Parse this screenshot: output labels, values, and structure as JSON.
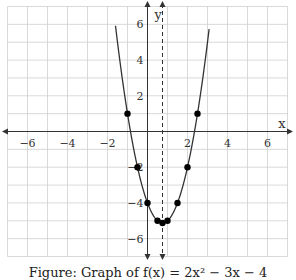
{
  "chart_data": {
    "type": "line",
    "title": "",
    "function": "f(x) = 2x^2 - 3x - 4",
    "xlabel": "x",
    "ylabel": "y",
    "xlim": [
      -7,
      7
    ],
    "ylim": [
      -7,
      7
    ],
    "grid": true,
    "x_tick_labels": [
      "-6",
      "-4",
      "-2",
      "2",
      "4",
      "6"
    ],
    "x_ticks": [
      -6,
      -4,
      -2,
      2,
      4,
      6
    ],
    "y_tick_labels": [
      "6",
      "4",
      "2",
      "-2",
      "-4",
      "-6"
    ],
    "y_ticks": [
      6,
      4,
      2,
      -2,
      -4,
      -6
    ],
    "axis_of_symmetry": {
      "x": 0.75,
      "style": "dashed"
    },
    "points": [
      {
        "x": -1,
        "y": 1
      },
      {
        "x": -0.5,
        "y": -2
      },
      {
        "x": 0,
        "y": -4
      },
      {
        "x": 0.5,
        "y": -5
      },
      {
        "x": 0.75,
        "y": -5.125
      },
      {
        "x": 1,
        "y": -5
      },
      {
        "x": 1.5,
        "y": -4
      },
      {
        "x": 2,
        "y": -2
      },
      {
        "x": 2.5,
        "y": 1
      }
    ],
    "colors": {
      "curve": "#333333",
      "grid": "#cfcfcf",
      "axis": "#333333",
      "points": "#000000"
    }
  },
  "caption": "Figure: Graph of f(x) = 2x² − 3x − 4"
}
